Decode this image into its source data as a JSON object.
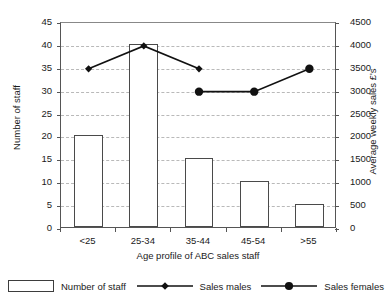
{
  "chart_data": {
    "type": "bar",
    "title": "",
    "subtitle": "",
    "xlabel": "Age profile of ABC sales staff",
    "ylabel": "Number of staff",
    "y2label": "Average weekly sales £'s",
    "categories": [
      "<25",
      "25-34",
      "35-44",
      "45-54",
      ">55"
    ],
    "ylim": [
      0,
      45
    ],
    "y2lim": [
      0,
      4500
    ],
    "yticks": [
      0,
      5,
      10,
      15,
      20,
      25,
      30,
      35,
      40,
      45
    ],
    "y2ticks": [
      0,
      500,
      1000,
      1500,
      2000,
      2500,
      3000,
      3500,
      4000,
      4500
    ],
    "grid": true,
    "legend_position": "bottom",
    "series": [
      {
        "name": "Number of staff",
        "type": "bar",
        "axis": "left",
        "values": [
          20,
          40,
          15,
          10,
          5
        ],
        "color": "#ffffff",
        "edge_color": "#4a4a4a"
      },
      {
        "name": "Sales males",
        "type": "line",
        "axis": "right",
        "marker": "diamond",
        "values": [
          3500,
          4000,
          3500,
          null,
          null
        ],
        "color": "#111111"
      },
      {
        "name": "Sales females",
        "type": "line",
        "axis": "right",
        "marker": "circle",
        "values": [
          null,
          null,
          3000,
          3000,
          3500
        ],
        "color": "#111111"
      }
    ]
  },
  "axes": {
    "left_tick_labels": [
      "0",
      "5",
      "10",
      "15",
      "20",
      "25",
      "30",
      "35",
      "40",
      "45"
    ],
    "right_tick_labels": [
      "0",
      "500",
      "1000",
      "1500",
      "2000",
      "2500",
      "3000",
      "3500",
      "4000",
      "4500"
    ],
    "left_title": "Number of staff",
    "right_title": "Average weekly sales £'s",
    "x_title": "Age profile of ABC sales staff"
  },
  "legend": {
    "items": [
      {
        "label": "Number of staff",
        "marker": "box-swatch"
      },
      {
        "label": "Sales males",
        "marker": "line-diamond"
      },
      {
        "label": "Sales females",
        "marker": "line-circle"
      }
    ]
  }
}
